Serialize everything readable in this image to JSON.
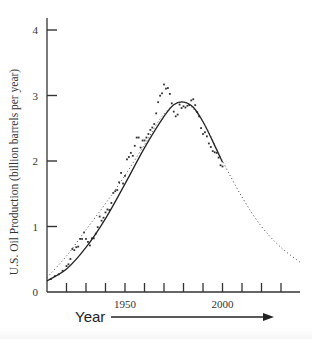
{
  "chart_data": {
    "type": "scatter",
    "title": "",
    "xlabel": "Year",
    "ylabel": "U.S. Oil Production (billion barrels per year)",
    "xlim": [
      1910,
      2040
    ],
    "ylim": [
      0,
      4
    ],
    "x_ticks": [
      1920,
      1930,
      1940,
      1950,
      1960,
      1970,
      1980,
      1990,
      2000,
      2010,
      2020,
      2030
    ],
    "x_tick_labels": [
      {
        "x": 1950,
        "label": "1950"
      },
      {
        "x": 2000,
        "label": "2000"
      }
    ],
    "y_ticks": [
      0,
      1,
      2,
      3,
      4
    ],
    "y_tick_labels": [
      "0",
      "1",
      "2",
      "3",
      "4"
    ],
    "grid": false,
    "legend": null,
    "series": [
      {
        "name": "Observed production",
        "style": "points",
        "x": [
          1912,
          1914,
          1916,
          1918,
          1920,
          1921,
          1922,
          1923,
          1924,
          1925,
          1926,
          1927,
          1928,
          1929,
          1930,
          1931,
          1932,
          1933,
          1934,
          1935,
          1936,
          1937,
          1938,
          1939,
          1940,
          1941,
          1942,
          1943,
          1944,
          1945,
          1946,
          1947,
          1948,
          1949,
          1950,
          1951,
          1952,
          1953,
          1954,
          1955,
          1956,
          1957,
          1958,
          1959,
          1960,
          1961,
          1962,
          1963,
          1964,
          1965,
          1966,
          1967,
          1968,
          1969,
          1970,
          1971,
          1972,
          1973,
          1974,
          1975,
          1976,
          1977,
          1978,
          1979,
          1980,
          1981,
          1982,
          1983,
          1984,
          1985,
          1986,
          1987,
          1988,
          1989,
          1990,
          1991,
          1992,
          1993,
          1994,
          1995,
          1996,
          1997,
          1998,
          1999,
          2000
        ],
        "y": [
          0.22,
          0.27,
          0.3,
          0.36,
          0.44,
          0.47,
          0.56,
          0.73,
          0.71,
          0.76,
          0.77,
          0.9,
          0.9,
          1.01,
          0.9,
          0.85,
          0.79,
          0.91,
          0.91,
          0.99,
          1.1,
          1.28,
          1.21,
          1.26,
          1.35,
          1.4,
          1.39,
          1.51,
          1.68,
          1.71,
          1.73,
          1.86,
          2.02,
          1.84,
          1.97,
          2.25,
          2.29,
          2.36,
          2.31,
          2.48,
          2.62,
          2.62,
          2.45,
          2.57,
          2.57,
          2.62,
          2.68,
          2.75,
          2.79,
          2.85,
          3.03,
          3.22,
          3.33,
          3.37,
          3.52,
          3.45,
          3.46,
          3.36,
          3.2,
          3.06,
          2.98,
          3.01,
          3.18,
          3.12,
          3.15,
          3.13,
          3.16,
          3.17,
          3.25,
          3.27,
          3.17,
          3.05,
          2.98,
          2.78,
          2.68,
          2.71,
          2.64,
          2.52,
          2.46,
          2.39,
          2.37,
          2.36,
          2.28,
          2.15,
          2.13
        ]
      },
      {
        "name": "Fitted curve (historic)",
        "style": "solid",
        "x": [
          1910,
          1920,
          1930,
          1940,
          1950,
          1960,
          1970,
          1975,
          1980,
          1985,
          1990,
          1995,
          2000
        ],
        "y": [
          0.17,
          0.35,
          0.68,
          1.12,
          1.65,
          2.2,
          2.68,
          2.86,
          2.9,
          2.82,
          2.6,
          2.3,
          1.98
        ]
      },
      {
        "name": "Projection",
        "style": "dotted",
        "x": [
          1910,
          1920,
          1930,
          1940,
          1950,
          1960,
          1970,
          1980,
          1990,
          2000,
          2010,
          2020,
          2030,
          2040
        ],
        "y": [
          0.22,
          0.55,
          0.95,
          1.35,
          1.78,
          2.25,
          2.72,
          2.9,
          2.6,
          2.0,
          1.45,
          1.0,
          0.68,
          0.45
        ]
      }
    ],
    "annotations": [
      {
        "text": "Year",
        "arrow": "right"
      }
    ]
  }
}
